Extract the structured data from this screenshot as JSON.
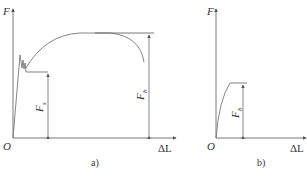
{
  "diagrams": [
    {
      "caption": "a)",
      "y_axis_label": "F",
      "x_axis_label": "ΔL",
      "origin_label": "O",
      "annotations": [
        {
          "symbol": "F",
          "subscript": "s"
        },
        {
          "symbol": "F",
          "subscript": "b"
        }
      ]
    },
    {
      "caption": "b)",
      "y_axis_label": "F",
      "x_axis_label": "ΔL",
      "origin_label": "O",
      "annotations": [
        {
          "symbol": "F",
          "subscript": "b"
        }
      ]
    }
  ],
  "colors": {
    "axis": "#555555",
    "curve": "#777777",
    "text": "#333333"
  }
}
